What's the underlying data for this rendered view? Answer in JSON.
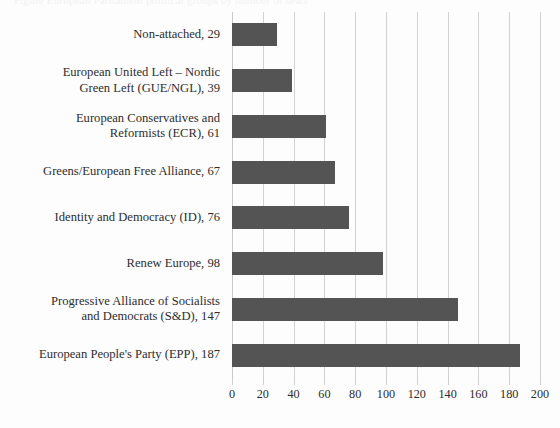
{
  "page": {
    "caption_sliver": "Figure   European Parliament political groups by number of seats"
  },
  "chart_data": {
    "type": "bar",
    "orientation": "horizontal",
    "title": "",
    "subtitle": "",
    "xlabel": "",
    "ylabel": "",
    "xlim": [
      0,
      200
    ],
    "ylim": null,
    "grid": true,
    "legend": false,
    "legend_position": "none",
    "bar_color": "#545454",
    "gridline_color": "#d2d2d2",
    "text_color": "#2d2d2d",
    "background_color": "#fdfdfd",
    "xticks": [
      0,
      20,
      40,
      60,
      80,
      100,
      120,
      140,
      160,
      180,
      200
    ],
    "xtick_labels": [
      "0",
      "20",
      "40",
      "60",
      "80",
      "100",
      "120",
      "140",
      "160",
      "180",
      "200"
    ],
    "categories": [
      "Non-attached",
      "European United Left – Nordic Green Left (GUE/NGL)",
      "European Conservatives and Reformists (ECR)",
      "Greens/European Free Alliance",
      "Identity and Democracy (ID)",
      "Renew Europe",
      "Progressive Alliance of Socialists and Democrats (S&D)",
      "European People's Party (EPP)"
    ],
    "category_labels": [
      "Non-attached, 29",
      "European United Left – Nordic\nGreen Left (GUE/NGL), 39",
      "European Conservatives and\nReformists (ECR), 61",
      "Greens/European Free Alliance, 67",
      "Identity and Democracy (ID), 76",
      "Renew Europe, 98",
      "Progressive Alliance of Socialists\nand Democrats (S&D), 147",
      "European People's Party (EPP), 187"
    ],
    "values": [
      29,
      39,
      61,
      67,
      76,
      98,
      147,
      187
    ]
  }
}
